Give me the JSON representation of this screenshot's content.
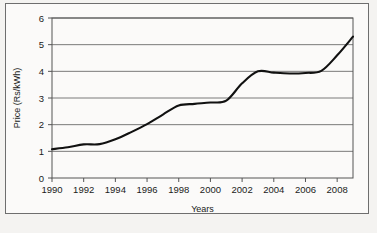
{
  "chart_data": {
    "type": "line",
    "title": "",
    "xlabel": "Years",
    "ylabel": "Price (Rs/kWh)",
    "xlim": [
      1990,
      2009
    ],
    "ylim": [
      0,
      6
    ],
    "grid": true,
    "legend": "none",
    "xtick_labels": [
      "1990",
      "1992",
      "1994",
      "1996",
      "1998",
      "2000",
      "2002",
      "2004",
      "2006",
      "2008"
    ],
    "xtick_values": [
      1990,
      1992,
      1994,
      1996,
      1998,
      2000,
      2002,
      2004,
      2006,
      2008
    ],
    "ytick_labels": [
      "0",
      "1",
      "2",
      "3",
      "4",
      "5",
      "6"
    ],
    "ytick_values": [
      0,
      1,
      2,
      3,
      4,
      5,
      6
    ],
    "series": [
      {
        "name": "Price",
        "color": "#111111",
        "x": [
          1990,
          1991,
          1992,
          1993,
          1994,
          1995,
          1996,
          1997,
          1998,
          1999,
          2000,
          2001,
          2002,
          2003,
          2004,
          2005,
          2006,
          2007,
          2008,
          2009
        ],
        "values": [
          1.08,
          1.15,
          1.26,
          1.27,
          1.45,
          1.72,
          2.02,
          2.38,
          2.72,
          2.78,
          2.83,
          2.9,
          3.55,
          4.0,
          3.95,
          3.92,
          3.94,
          4.02,
          4.6,
          5.3
        ]
      }
    ]
  },
  "axes": {
    "y_label_text": "Price (Rs/kWh)",
    "x_label_text": "Years"
  },
  "colors": {
    "line": "#111111",
    "grid": "#7a7a7a",
    "axis": "#555555",
    "plot_background": "#ffffff",
    "page_background": "#f4f3f1",
    "frame": "#6e6e6e",
    "text": "#1a1a1a"
  }
}
